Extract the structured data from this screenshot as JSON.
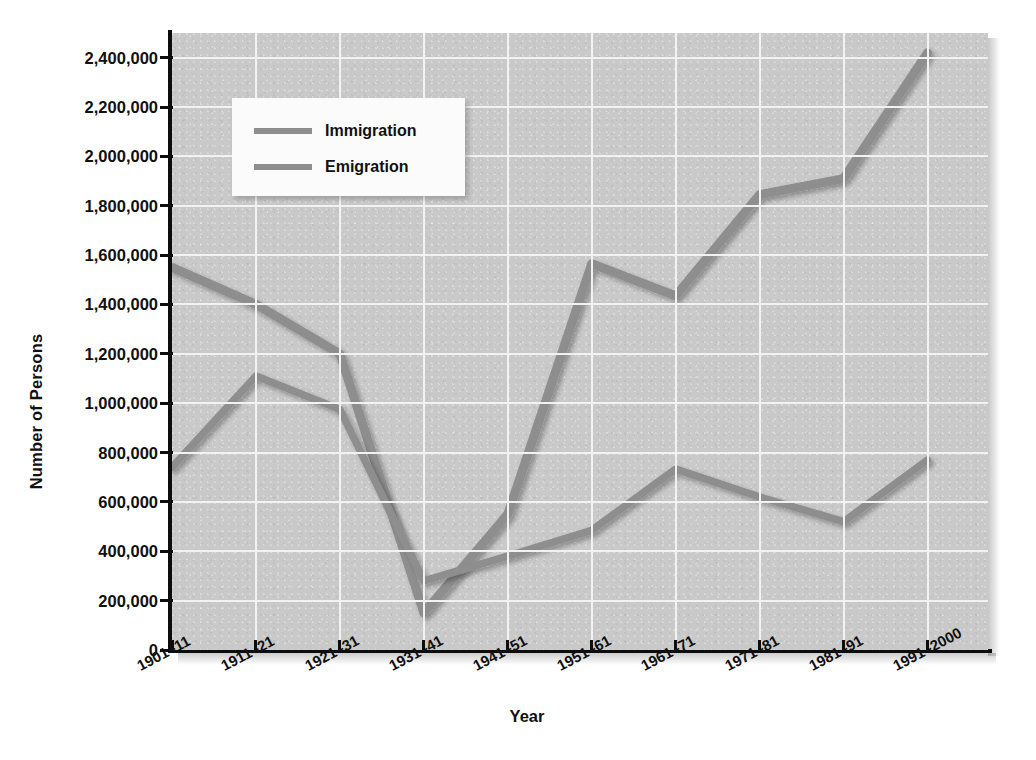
{
  "chart_data": {
    "type": "line",
    "title": "",
    "xlabel": "Year",
    "ylabel": "Number of Persons",
    "categories": [
      "1901–11",
      "1911–21",
      "1921–31",
      "1931–41",
      "1941–51",
      "1951–61",
      "1961–71",
      "1971–81",
      "1981–91",
      "1991–2000"
    ],
    "series": [
      {
        "name": "Immigration",
        "color": "#8e8e8e",
        "values": [
          1550000,
          1400000,
          1200000,
          150000,
          550000,
          1565000,
          1435000,
          1845000,
          1910000,
          2420000
        ]
      },
      {
        "name": "Emigration",
        "color": "#8e8e8e",
        "values": [
          740000,
          1110000,
          975000,
          280000,
          380000,
          485000,
          733000,
          620000,
          520000,
          770000
        ]
      }
    ],
    "ylim": [
      0,
      2500000
    ],
    "ytick_values": [
      0,
      200000,
      400000,
      600000,
      800000,
      1000000,
      1200000,
      1400000,
      1600000,
      1800000,
      2000000,
      2200000,
      2400000
    ],
    "ytick_labels": [
      "0",
      "200,000",
      "400,000",
      "600,000",
      "800,000",
      "1,000,000",
      "1,200,000",
      "1,400,000",
      "1,600,000",
      "1,800,000",
      "2,000,000",
      "2,200,000",
      "2,400,000"
    ],
    "grid": true,
    "grid_color": "#f2f2f2",
    "plot_background": "#c9c9c9",
    "legend_position": "upper-left",
    "legend_entries": [
      "Immigration",
      "Emigration"
    ]
  },
  "axes": {
    "ylabel": "Number of Persons",
    "xlabel": "Year"
  }
}
